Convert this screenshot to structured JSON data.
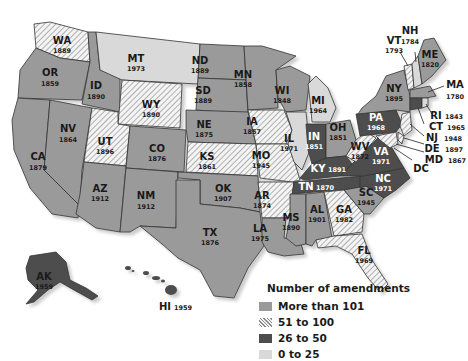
{
  "map": {
    "title": "State constitutions: year adopted and number of amendments",
    "colors": {
      "more_than_101": "#9a9a9a",
      "51_to_100": "hatched",
      "26_to_50": "#4d4d4d",
      "0_to_25": "#d9d9d9"
    },
    "states": [
      {
        "abbr": "WA",
        "year": "1889",
        "category": "51 to 100"
      },
      {
        "abbr": "OR",
        "year": "1859",
        "category": "More than 101"
      },
      {
        "abbr": "CA",
        "year": "1879",
        "category": "More than 101"
      },
      {
        "abbr": "ID",
        "year": "1890",
        "category": "More than 101"
      },
      {
        "abbr": "NV",
        "year": "1864",
        "category": "More than 101"
      },
      {
        "abbr": "MT",
        "year": "1973",
        "category": "0 to 25"
      },
      {
        "abbr": "WY",
        "year": "1890",
        "category": "51 to 100"
      },
      {
        "abbr": "UT",
        "year": "1896",
        "category": "51 to 100"
      },
      {
        "abbr": "AZ",
        "year": "1912",
        "category": "More than 101"
      },
      {
        "abbr": "CO",
        "year": "1876",
        "category": "More than 101"
      },
      {
        "abbr": "NM",
        "year": "1912",
        "category": "More than 101"
      },
      {
        "abbr": "ND",
        "year": "1889",
        "category": "More than 101"
      },
      {
        "abbr": "SD",
        "year": "1889",
        "category": "More than 101"
      },
      {
        "abbr": "NE",
        "year": "1875",
        "category": "More than 101"
      },
      {
        "abbr": "KS",
        "year": "1861",
        "category": "51 to 100"
      },
      {
        "abbr": "OK",
        "year": "1907",
        "category": "More than 101"
      },
      {
        "abbr": "TX",
        "year": "1876",
        "category": "More than 101"
      },
      {
        "abbr": "MN",
        "year": "1858",
        "category": "More than 101"
      },
      {
        "abbr": "IA",
        "year": "1857",
        "category": "51 to 100"
      },
      {
        "abbr": "MO",
        "year": "1945",
        "category": "51 to 100"
      },
      {
        "abbr": "AR",
        "year": "1874",
        "category": "51 to 100"
      },
      {
        "abbr": "LA",
        "year": "1975",
        "category": "0 to 25"
      },
      {
        "abbr": "WI",
        "year": "1848",
        "category": "More than 101"
      },
      {
        "abbr": "IL",
        "year": "1971",
        "category": "0 to 25"
      },
      {
        "abbr": "MI",
        "year": "1964",
        "category": "0 to 25"
      },
      {
        "abbr": "IN",
        "year": "1851",
        "category": "26 to 50"
      },
      {
        "abbr": "OH",
        "year": "1851",
        "category": "More than 101"
      },
      {
        "abbr": "KY",
        "year": "1891",
        "category": "26 to 50"
      },
      {
        "abbr": "TN",
        "year": "1870",
        "category": "26 to 50"
      },
      {
        "abbr": "MS",
        "year": "1890",
        "category": "More than 101"
      },
      {
        "abbr": "AL",
        "year": "1901",
        "category": "More than 101"
      },
      {
        "abbr": "GA",
        "year": "1982",
        "category": "51 to 100"
      },
      {
        "abbr": "FL",
        "year": "1969",
        "category": "51 to 100"
      },
      {
        "abbr": "SC",
        "year": "1945",
        "category": "More than 101"
      },
      {
        "abbr": "NC",
        "year": "1971",
        "category": "26 to 50"
      },
      {
        "abbr": "VA",
        "year": "1971",
        "category": "26 to 50"
      },
      {
        "abbr": "WV",
        "year": "1872",
        "category": "51 to 100"
      },
      {
        "abbr": "PA",
        "year": "1968",
        "category": "26 to 50"
      },
      {
        "abbr": "NY",
        "year": "1895",
        "category": "More than 101"
      },
      {
        "abbr": "VT",
        "year": "1793",
        "category": "51 to 100"
      },
      {
        "abbr": "NH",
        "year": "1784",
        "category": "0 to 25"
      },
      {
        "abbr": "ME",
        "year": "1820",
        "category": "More than 101"
      },
      {
        "abbr": "MA",
        "year": "1780",
        "category": "More than 101"
      },
      {
        "abbr": "RI",
        "year": "1843",
        "category": "0 to 25"
      },
      {
        "abbr": "CT",
        "year": "1965",
        "category": "26 to 50"
      },
      {
        "abbr": "NJ",
        "year": "1948",
        "category": "51 to 100"
      },
      {
        "abbr": "DE",
        "year": "1897",
        "category": "51 to 100"
      },
      {
        "abbr": "MD",
        "year": "1867",
        "category": "51 to 100"
      },
      {
        "abbr": "DC",
        "year": "",
        "category": ""
      },
      {
        "abbr": "AK",
        "year": "1959",
        "category": "26 to 50"
      },
      {
        "abbr": "HI",
        "year": "1959",
        "category": "0 to 25"
      }
    ]
  },
  "legend": {
    "title": "Number of amendments",
    "items": [
      {
        "label": "More than 101",
        "swatch": "#9a9a9a"
      },
      {
        "label": "51 to 100",
        "swatch": "hatched"
      },
      {
        "label": "26 to 50",
        "swatch": "#4d4d4d"
      },
      {
        "label": "0 to 25",
        "swatch": "#d9d9d9"
      }
    ]
  }
}
